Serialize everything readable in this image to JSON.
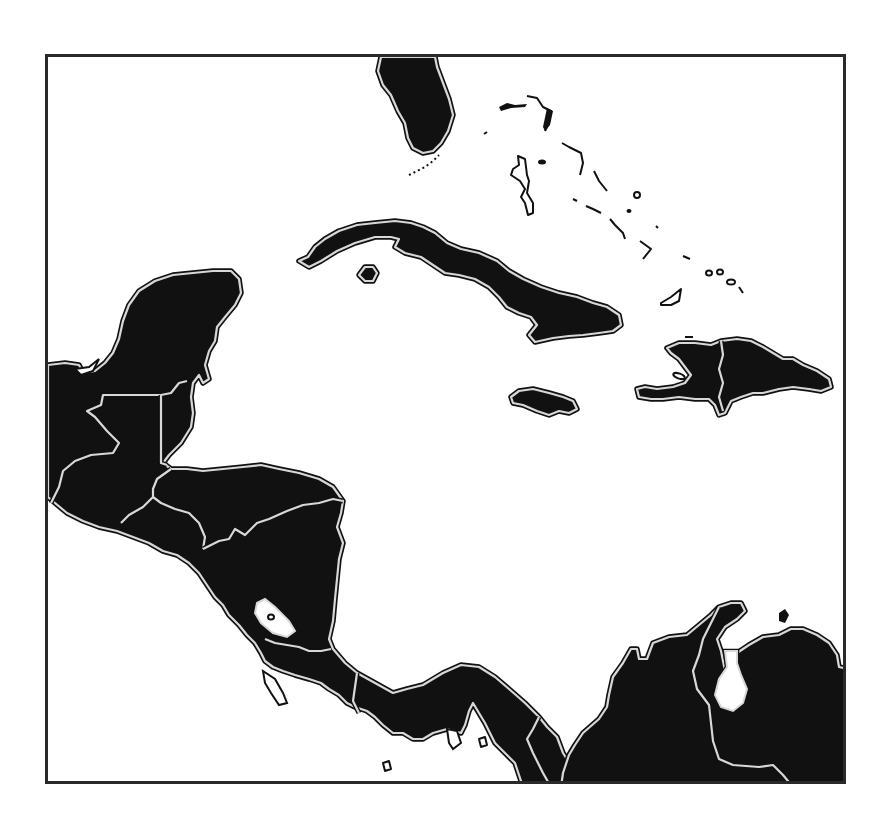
{
  "map": {
    "title": "",
    "type": "outline map",
    "region": "Central America and the Caribbean",
    "labels_visible": false,
    "colors": {
      "land": "#111111",
      "coast_outline": "#d8d8d8",
      "water": "#ffffff",
      "frame": "#2a2a2a"
    },
    "features": [
      {
        "id": "florida",
        "kind": "landmass",
        "name": "Florida peninsula"
      },
      {
        "id": "bahamas",
        "kind": "island-chain",
        "name": "Bahamas"
      },
      {
        "id": "cuba",
        "kind": "island",
        "name": "Cuba"
      },
      {
        "id": "isla-juventud",
        "kind": "island",
        "name": "Isla de la Juventud"
      },
      {
        "id": "jamaica",
        "kind": "island",
        "name": "Jamaica"
      },
      {
        "id": "hispaniola",
        "kind": "island",
        "name": "Hispaniola (Haiti / Dominican Republic)"
      },
      {
        "id": "yucatan",
        "kind": "landmass",
        "name": "Yucatán / Mexico"
      },
      {
        "id": "guatemala",
        "kind": "country",
        "name": "Guatemala"
      },
      {
        "id": "belize",
        "kind": "country",
        "name": "Belize"
      },
      {
        "id": "el-salvador",
        "kind": "country",
        "name": "El Salvador"
      },
      {
        "id": "honduras",
        "kind": "country",
        "name": "Honduras"
      },
      {
        "id": "nicaragua",
        "kind": "country",
        "name": "Nicaragua"
      },
      {
        "id": "lake-nicaragua",
        "kind": "lake",
        "name": "Lake Nicaragua"
      },
      {
        "id": "costa-rica",
        "kind": "country",
        "name": "Costa Rica"
      },
      {
        "id": "panama",
        "kind": "country",
        "name": "Panama"
      },
      {
        "id": "colombia",
        "kind": "country",
        "name": "Colombia"
      },
      {
        "id": "venezuela",
        "kind": "country",
        "name": "Venezuela"
      },
      {
        "id": "lake-maracaibo",
        "kind": "lake",
        "name": "Lake Maracaibo"
      }
    ]
  }
}
